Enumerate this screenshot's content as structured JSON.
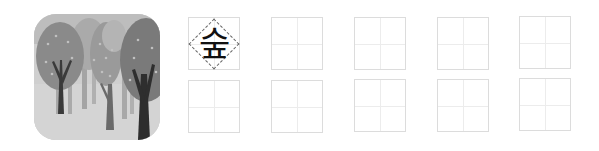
{
  "illustration": {
    "subject": "forest-trees",
    "description": "Grayscale illustration of a forest with trees"
  },
  "writing_practice": {
    "character": "숲",
    "rows": 2,
    "columns": 5,
    "cells": [
      {
        "row": 1,
        "col": 1,
        "content": "숲",
        "guide": "diamond-dashed"
      },
      {
        "row": 1,
        "col": 2,
        "content": ""
      },
      {
        "row": 1,
        "col": 3,
        "content": ""
      },
      {
        "row": 1,
        "col": 4,
        "content": ""
      },
      {
        "row": 1,
        "col": 5,
        "content": ""
      },
      {
        "row": 2,
        "col": 1,
        "content": ""
      },
      {
        "row": 2,
        "col": 2,
        "content": ""
      },
      {
        "row": 2,
        "col": 3,
        "content": ""
      },
      {
        "row": 2,
        "col": 4,
        "content": ""
      },
      {
        "row": 2,
        "col": 5,
        "content": ""
      }
    ]
  },
  "colors": {
    "grid_border": "#dcdcdc",
    "grid_guide": "#ececec",
    "glyph": "#111111"
  }
}
